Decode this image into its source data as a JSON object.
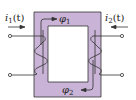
{
  "diagram": {
    "colors": {
      "core_fill": "#c9b3d6",
      "core_stroke": "#333333",
      "wire": "#333333",
      "background": "#ffffff"
    },
    "labels": {
      "i1_main": "i",
      "i1_sub": "1",
      "i1_arg": "(t)",
      "i2_main": "i",
      "i2_sub": "2",
      "i2_arg": "(t)",
      "phi1_main": "φ",
      "phi1_sub": "1",
      "phi2_main": "φ",
      "phi2_sub": "2"
    },
    "components": [
      {
        "name": "core",
        "type": "rectangular-ring"
      },
      {
        "name": "primary-winding",
        "side": "left",
        "current": "i1(t)",
        "arrow": "right"
      },
      {
        "name": "secondary-winding",
        "side": "right",
        "current": "i2(t)",
        "arrow": "left"
      },
      {
        "name": "flux-phi1",
        "location": "top-left",
        "direction": "clockwise"
      },
      {
        "name": "flux-phi2",
        "location": "bottom-right",
        "direction": "clockwise"
      }
    ]
  }
}
